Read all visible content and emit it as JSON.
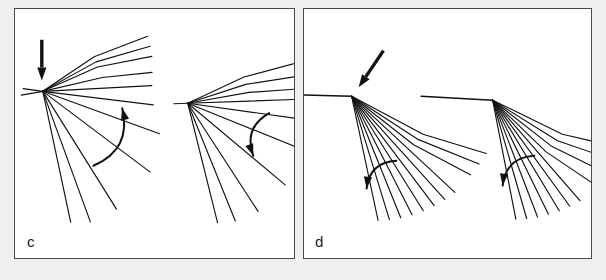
{
  "figure": {
    "kind": "line-diagram",
    "panel_count": 2,
    "background_color": "#f0efed",
    "panel_background_color": "#ffffff",
    "border_color": "#4a4a48",
    "stroke_color": "#111111"
  },
  "panels": [
    {
      "id": "c",
      "label": "c",
      "diagram_count": 2,
      "diagrams": [
        {
          "id": "c-left",
          "name": "fan-diagram-c-left",
          "hub": {
            "x": 28,
            "y": 83
          },
          "straight_arrow": {
            "name": "down-arrow",
            "direction": "down",
            "from": {
              "x": 27,
              "y": 31
            },
            "to": {
              "x": 27,
              "y": 72
            }
          },
          "curved_arrow": {
            "name": "rotation-arc-arrow",
            "direction": "counter-clockwise-up",
            "arc_start": {
              "x": 79,
              "y": 158
            },
            "arc_end": {
              "x": 108,
              "y": 100
            },
            "head_at": "arc_end"
          },
          "rays": [
            {
              "angle_deg": -34,
              "length": 120,
              "kink_at": 0.52,
              "kink_angle_deg": -21
            },
            {
              "angle_deg": -29,
              "length": 118,
              "kink_at": 0.52,
              "kink_angle_deg": -16
            },
            {
              "angle_deg": -24,
              "length": 116,
              "kink_at": 0.52,
              "kink_angle_deg": -11
            },
            {
              "angle_deg": -13,
              "length": 112,
              "kink_at": 0.55,
              "kink_angle_deg": -6
            },
            {
              "angle_deg": -3,
              "length": 110,
              "kink_at": 0.0,
              "kink_angle_deg": -3
            },
            {
              "angle_deg": 7,
              "length": 112,
              "kink_at": 0.0,
              "kink_angle_deg": 7
            },
            {
              "angle_deg": 20,
              "length": 125,
              "kink_at": 0.0,
              "kink_angle_deg": 20
            },
            {
              "angle_deg": 37,
              "length": 135,
              "kink_at": 0.0,
              "kink_angle_deg": 37
            },
            {
              "angle_deg": 58,
              "length": 140,
              "kink_at": 0.0,
              "kink_angle_deg": 58
            },
            {
              "angle_deg": 70,
              "length": 140,
              "kink_at": 0.0,
              "kink_angle_deg": 70
            },
            {
              "angle_deg": 78,
              "length": 135,
              "kink_at": 0.0,
              "kink_angle_deg": 78
            },
            {
              "angle_deg": 170,
              "length": 22,
              "kink_at": 0.0,
              "kink_angle_deg": 170
            },
            {
              "angle_deg": 188,
              "length": 20,
              "kink_at": 0.0,
              "kink_angle_deg": 188
            }
          ]
        },
        {
          "id": "c-right",
          "name": "fan-diagram-c-right",
          "hub": {
            "x": 174,
            "y": 95
          },
          "straight_arrow": null,
          "curved_arrow": {
            "name": "rotation-arc-arrow",
            "direction": "clockwise-down",
            "arc_start": {
              "x": 256,
              "y": 105
            },
            "arc_end": {
              "x": 240,
              "y": 148
            },
            "head_at": "arc_end"
          },
          "rays": [
            {
              "angle_deg": -25,
              "length": 120,
              "kink_at": 0.52,
              "kink_angle_deg": -15
            },
            {
              "angle_deg": -18,
              "length": 118,
              "kink_at": 0.52,
              "kink_angle_deg": -9
            },
            {
              "angle_deg": -10,
              "length": 114,
              "kink_at": 0.55,
              "kink_angle_deg": -4
            },
            {
              "angle_deg": -2,
              "length": 112,
              "kink_at": 0.0,
              "kink_angle_deg": -2
            },
            {
              "angle_deg": 8,
              "length": 115,
              "kink_at": 0.0,
              "kink_angle_deg": 8
            },
            {
              "angle_deg": 22,
              "length": 122,
              "kink_at": 0.0,
              "kink_angle_deg": 22
            },
            {
              "angle_deg": 40,
              "length": 128,
              "kink_at": 0.0,
              "kink_angle_deg": 40
            },
            {
              "angle_deg": 57,
              "length": 130,
              "kink_at": 0.0,
              "kink_angle_deg": 57
            },
            {
              "angle_deg": 68,
              "length": 128,
              "kink_at": 0.0,
              "kink_angle_deg": 68
            },
            {
              "angle_deg": 76,
              "length": 124,
              "kink_at": 0.0,
              "kink_angle_deg": 76
            },
            {
              "angle_deg": 178,
              "length": 14,
              "kink_at": 0.0,
              "kink_angle_deg": 178
            }
          ]
        }
      ]
    },
    {
      "id": "d",
      "label": "d",
      "diagram_count": 2,
      "diagrams": [
        {
          "id": "d-left",
          "name": "fan-diagram-d-left",
          "hub": {
            "x": 48,
            "y": 88
          },
          "straight_arrow": {
            "name": "diagonal-arrow",
            "direction": "down-left",
            "from": {
              "x": 80,
              "y": 42
            },
            "to": {
              "x": 55,
              "y": 79
            }
          },
          "curved_arrow": {
            "name": "rotation-arc-arrow",
            "direction": "counter-clockwise",
            "arc_start": {
              "x": 63,
              "y": 181
            },
            "arc_end": {
              "x": 93,
              "y": 153
            },
            "head_at": "arc_start"
          },
          "spine": {
            "name": "horizontal-spine",
            "from": {
              "x": -26,
              "y": 86
            },
            "to": {
              "x": 48,
              "y": 88
            }
          },
          "rays": [
            {
              "angle_deg": 78,
              "length": 128,
              "kink_at": 0.0,
              "kink_angle_deg": 78
            },
            {
              "angle_deg": 73,
              "length": 130,
              "kink_at": 0.0,
              "kink_angle_deg": 73
            },
            {
              "angle_deg": 68,
              "length": 132,
              "kink_at": 0.0,
              "kink_angle_deg": 68
            },
            {
              "angle_deg": 63,
              "length": 134,
              "kink_at": 0.0,
              "kink_angle_deg": 63
            },
            {
              "angle_deg": 58,
              "length": 136,
              "kink_at": 0.0,
              "kink_angle_deg": 58
            },
            {
              "angle_deg": 53,
              "length": 138,
              "kink_at": 0.0,
              "kink_angle_deg": 53
            },
            {
              "angle_deg": 48,
              "length": 140,
              "kink_at": 0.0,
              "kink_angle_deg": 48
            },
            {
              "angle_deg": 43,
              "length": 142,
              "kink_at": 0.0,
              "kink_angle_deg": 43
            },
            {
              "angle_deg": 38,
              "length": 144,
              "kink_at": 0.55,
              "kink_angle_deg": 28
            },
            {
              "angle_deg": 33,
              "length": 146,
              "kink_at": 0.55,
              "kink_angle_deg": 22
            },
            {
              "angle_deg": 28,
              "length": 148,
              "kink_at": 0.55,
              "kink_angle_deg": 17
            }
          ]
        },
        {
          "id": "d-right",
          "name": "fan-diagram-d-right",
          "hub": {
            "x": 190,
            "y": 92
          },
          "straight_arrow": null,
          "curved_arrow": {
            "name": "rotation-arc-arrow",
            "direction": "counter-clockwise",
            "arc_start": {
              "x": 200,
              "y": 178
            },
            "arc_end": {
              "x": 232,
              "y": 148
            },
            "head_at": "arc_start"
          },
          "spine": {
            "name": "horizontal-spine",
            "from": {
              "x": 118,
              "y": 88
            },
            "to": {
              "x": 190,
              "y": 92
            }
          },
          "rays": [
            {
              "angle_deg": 79,
              "length": 122,
              "kink_at": 0.0,
              "kink_angle_deg": 79
            },
            {
              "angle_deg": 74,
              "length": 124,
              "kink_at": 0.0,
              "kink_angle_deg": 74
            },
            {
              "angle_deg": 69,
              "length": 126,
              "kink_at": 0.0,
              "kink_angle_deg": 69
            },
            {
              "angle_deg": 64,
              "length": 128,
              "kink_at": 0.0,
              "kink_angle_deg": 64
            },
            {
              "angle_deg": 59,
              "length": 130,
              "kink_at": 0.0,
              "kink_angle_deg": 59
            },
            {
              "angle_deg": 54,
              "length": 132,
              "kink_at": 0.0,
              "kink_angle_deg": 54
            },
            {
              "angle_deg": 49,
              "length": 134,
              "kink_at": 0.0,
              "kink_angle_deg": 49
            },
            {
              "angle_deg": 44,
              "length": 136,
              "kink_at": 0.55,
              "kink_angle_deg": 34
            },
            {
              "angle_deg": 38,
              "length": 138,
              "kink_at": 0.55,
              "kink_angle_deg": 26
            },
            {
              "angle_deg": 32,
              "length": 140,
              "kink_at": 0.55,
              "kink_angle_deg": 19
            },
            {
              "angle_deg": 26,
              "length": 142,
              "kink_at": 0.55,
              "kink_angle_deg": 13
            }
          ]
        }
      ]
    }
  ]
}
